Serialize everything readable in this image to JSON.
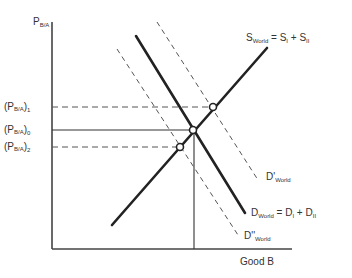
{
  "diagram": {
    "type": "supply-demand",
    "y_axis": {
      "label": "P",
      "label_sub": "B/A"
    },
    "x_axis": {
      "label": "Good B"
    },
    "price_levels": [
      {
        "id": "p1",
        "label": "(P",
        "sub": "B/A",
        "suffix": ")",
        "index": "1",
        "line": "dashed"
      },
      {
        "id": "p0",
        "label": "(P",
        "sub": "B/A",
        "suffix": ")",
        "index": "0",
        "line": "solid"
      },
      {
        "id": "p2",
        "label": "(P",
        "sub": "B/A",
        "suffix": ")",
        "index": "2",
        "line": "dashed"
      }
    ],
    "curves": {
      "supply": {
        "name": "S",
        "sub": "World",
        "eq": " = S",
        "sub1": "I",
        "plus": " + S",
        "sub2": "II",
        "style": "solid"
      },
      "demand": {
        "name": "D",
        "sub": "World",
        "eq": " = D",
        "sub1": "I",
        "plus": " + D",
        "sub2": "II",
        "style": "solid"
      },
      "demand_high": {
        "name": "D'",
        "sub": "World",
        "style": "dashed"
      },
      "demand_low": {
        "name": "D''",
        "sub": "World",
        "style": "dashed"
      }
    },
    "equilibria": [
      {
        "id": "e1",
        "price": "(PB/A)1",
        "curve": "D'World"
      },
      {
        "id": "e0",
        "price": "(PB/A)0",
        "curve": "DWorld"
      },
      {
        "id": "e2",
        "price": "(PB/A)2",
        "curve": "D''World"
      }
    ],
    "colors": {
      "lines": "#222222",
      "axis": "#444444",
      "background": "#ffffff"
    }
  }
}
